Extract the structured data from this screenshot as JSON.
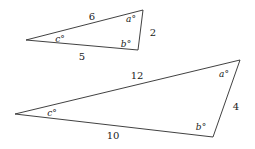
{
  "figure": {
    "type": "geometry-diagram",
    "stroke_color": "#2b2b2b",
    "text_color": "#1a1a1a",
    "background_color": "#ffffff",
    "width": 255,
    "height": 149
  },
  "shapes": [
    {
      "name": "small-triangle",
      "points": "26,40 143,10 138,50",
      "vertices": [
        {
          "name": "left",
          "x": 26,
          "y": 40
        },
        {
          "name": "top-right",
          "x": 143,
          "y": 10
        },
        {
          "name": "bottom-right",
          "x": 138,
          "y": 50
        }
      ],
      "sides": [
        {
          "name": "top-side",
          "label": "6",
          "x": 92,
          "y": 17
        },
        {
          "name": "bottom-side",
          "label": "5",
          "x": 82,
          "y": 57
        },
        {
          "name": "right-side",
          "label": "2",
          "x": 153,
          "y": 33
        }
      ],
      "angles": [
        {
          "name": "angle-c",
          "label": "c°",
          "x": 60,
          "y": 39
        },
        {
          "name": "angle-a",
          "label": "a°",
          "x": 131,
          "y": 19
        },
        {
          "name": "angle-b",
          "label": "b°",
          "x": 126,
          "y": 44
        }
      ]
    },
    {
      "name": "large-triangle",
      "points": "15,114 240,60 213,137",
      "vertices": [
        {
          "name": "left",
          "x": 15,
          "y": 114
        },
        {
          "name": "top-right",
          "x": 240,
          "y": 60
        },
        {
          "name": "bottom-right",
          "x": 213,
          "y": 137
        }
      ],
      "sides": [
        {
          "name": "top-side",
          "label": "12",
          "x": 137,
          "y": 76
        },
        {
          "name": "bottom-side",
          "label": "10",
          "x": 113,
          "y": 136
        },
        {
          "name": "right-side",
          "label": "4",
          "x": 236,
          "y": 107
        }
      ],
      "angles": [
        {
          "name": "angle-c",
          "label": "c°",
          "x": 52,
          "y": 113
        },
        {
          "name": "angle-a",
          "label": "a°",
          "x": 224,
          "y": 74
        },
        {
          "name": "angle-b",
          "label": "b°",
          "x": 201,
          "y": 127
        }
      ]
    }
  ]
}
